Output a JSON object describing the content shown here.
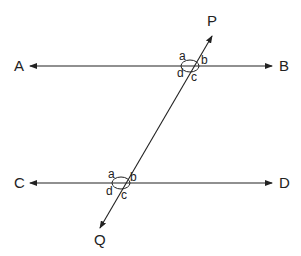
{
  "diagram": {
    "lines": [
      {
        "id": "AB",
        "start_label": "A",
        "end_label": "B",
        "type": "double-arrow line"
      },
      {
        "id": "CD",
        "start_label": "C",
        "end_label": "D",
        "type": "double-arrow line"
      },
      {
        "id": "PQ",
        "start_label": "P",
        "end_label": "Q",
        "type": "transversal"
      }
    ],
    "labels": {
      "A": "A",
      "B": "B",
      "C": "C",
      "D": "D",
      "P": "P",
      "Q": "Q"
    },
    "upper_intersection": {
      "a": "a",
      "b": "b",
      "c": "c",
      "d": "d"
    },
    "lower_intersection": {
      "a": "a",
      "b": "b",
      "c": "c",
      "d": "d"
    },
    "colors": {
      "line": "#222222",
      "background": "#ffffff"
    }
  }
}
